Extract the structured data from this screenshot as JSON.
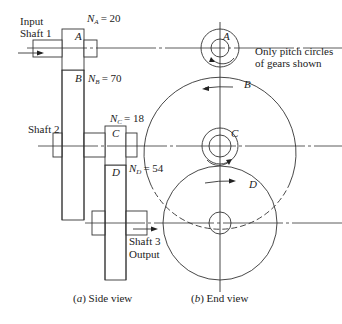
{
  "diagram": {
    "note": "Only pitch circles of gears shown",
    "note_lines": [
      "Only pitch circles",
      "of gears shown"
    ],
    "input_label_lines": [
      "Input",
      "Shaft 1"
    ],
    "shaft2_label": "Shaft 2",
    "output_label_lines": [
      "Shaft 3",
      "Output"
    ],
    "gears": [
      {
        "id": "A",
        "teeth_label": "N",
        "sub": "A",
        "teeth": "= 20"
      },
      {
        "id": "B",
        "teeth_label": "N",
        "sub": "B",
        "teeth": "= 70"
      },
      {
        "id": "C",
        "teeth_label": "N",
        "sub": "C",
        "teeth": "= 18"
      },
      {
        "id": "D",
        "teeth_label": "N",
        "sub": "D",
        "teeth": "= 54"
      }
    ],
    "captions": {
      "side_prefix": "(",
      "side_letter": "a",
      "side_text": ") Side view",
      "end_prefix": "(",
      "end_letter": "b",
      "end_text": ") End view"
    }
  }
}
